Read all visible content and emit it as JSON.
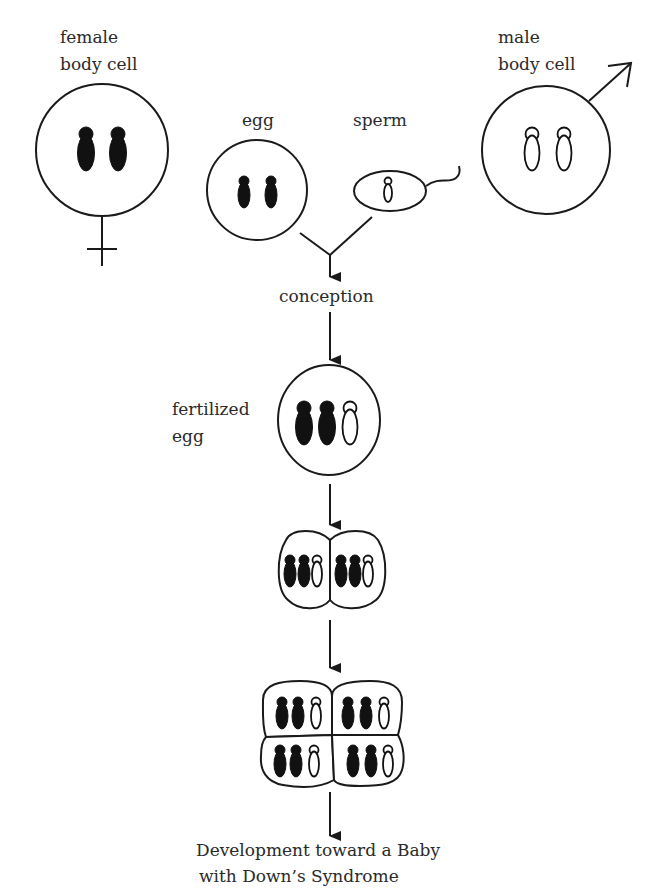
{
  "diagram": {
    "labels": {
      "female_cell": [
        "female",
        "body cell"
      ],
      "male_cell": [
        "male",
        "body cell"
      ],
      "egg": "egg",
      "sperm": "sperm",
      "conception": "conception",
      "fertilized_egg": [
        "fertilized",
        "egg"
      ],
      "outcome": [
        "Development toward a Baby",
        "with Down’s Syndrome"
      ]
    },
    "nodes": [
      {
        "id": "female_cell",
        "label": "female body cell",
        "symbol": "female-symbol",
        "chromosomes": {
          "dark": 2,
          "light": 0
        }
      },
      {
        "id": "male_cell",
        "label": "male body cell",
        "symbol": "male-symbol",
        "chromosomes": {
          "dark": 0,
          "light": 2
        }
      },
      {
        "id": "egg",
        "label": "egg",
        "chromosomes": {
          "dark": 2,
          "light": 0
        }
      },
      {
        "id": "sperm",
        "label": "sperm",
        "chromosomes": {
          "dark": 0,
          "light": 1
        }
      },
      {
        "id": "conception",
        "label": "conception"
      },
      {
        "id": "fertilized_egg",
        "label": "fertilized egg",
        "chromosomes": {
          "dark": 2,
          "light": 1
        }
      },
      {
        "id": "two_cell",
        "label": "",
        "cells": 2,
        "chromosomes_per_cell": {
          "dark": 2,
          "light": 1
        }
      },
      {
        "id": "four_cell",
        "label": "",
        "cells": 4,
        "chromosomes_per_cell": {
          "dark": 2,
          "light": 1
        }
      },
      {
        "id": "outcome",
        "label": "Development toward a Baby with Down's Syndrome"
      }
    ],
    "edges": [
      {
        "from": "egg",
        "to": "conception"
      },
      {
        "from": "sperm",
        "to": "conception"
      },
      {
        "from": "conception",
        "to": "fertilized_egg"
      },
      {
        "from": "fertilized_egg",
        "to": "two_cell"
      },
      {
        "from": "two_cell",
        "to": "four_cell"
      },
      {
        "from": "four_cell",
        "to": "outcome"
      }
    ]
  }
}
